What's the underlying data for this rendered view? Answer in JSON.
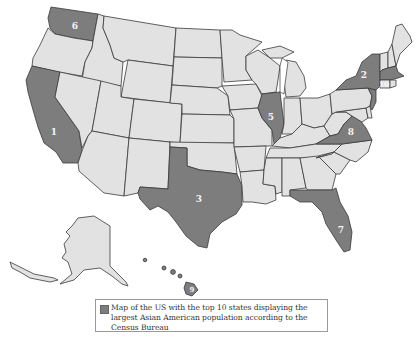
{
  "map": {
    "title": "Map of the US with the top 10 states displaying the largest Asian American population according to the Census Bureau",
    "highlight_color": "#7d7d7d",
    "base_color": "#e2e2e2",
    "border_color": "#3a3a3a",
    "ranked_states": [
      {
        "rank": "1",
        "state": "California"
      },
      {
        "rank": "2",
        "state": "New York"
      },
      {
        "rank": "3",
        "state": "Texas"
      },
      {
        "rank": "5",
        "state": "Illinois"
      },
      {
        "rank": "6",
        "state": "Washington"
      },
      {
        "rank": "7",
        "state": "Florida"
      },
      {
        "rank": "8",
        "state": "Virginia"
      },
      {
        "rank": "9",
        "state": "Hawaii"
      },
      {
        "rank": "10",
        "state": "Massachusetts"
      }
    ],
    "unlabeled_highlighted": [
      "New Jersey"
    ]
  },
  "legend": {
    "text": "Map of the US with the top 10 states displaying the largest Asian American population according to the Census Bureau"
  }
}
